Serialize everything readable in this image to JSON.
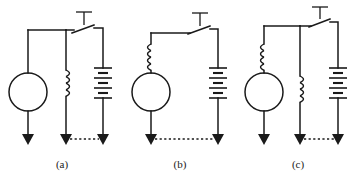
{
  "figure": {
    "background_color": "#ffffff",
    "line_color": "#1a1a1a",
    "width": 357,
    "height": 176
  },
  "circuits": [
    {
      "id": "a",
      "caption": "(a)",
      "caption_x": 62,
      "caption_y": 166,
      "branches": [
        "source",
        "inductor",
        "battery"
      ],
      "elements": {
        "source": {
          "name": "circle-source",
          "shape": "circle",
          "cx": 28,
          "cy": 92,
          "r": 19
        },
        "inductor": {
          "name": "inductor-coil",
          "turns": 4,
          "x": 65,
          "y_top": 70,
          "y_bottom": 96
        },
        "battery": {
          "name": "battery-cells",
          "cells": 3,
          "x": 103,
          "y_top": 68,
          "y_bottom": 100
        },
        "switch": {
          "name": "push-button-switch",
          "x_left": 66,
          "x_right": 103,
          "y": 30,
          "actuator": "T"
        }
      },
      "terminals": [
        {
          "name": "arrow-terminal-left",
          "x": 28,
          "y": 143
        },
        {
          "name": "arrow-terminal-middle",
          "x": 66,
          "y": 143
        },
        {
          "name": "arrow-terminal-right",
          "x": 103,
          "y": 143
        }
      ],
      "dashed_link": {
        "name": "dashed-connection",
        "x1": 68,
        "x2": 101,
        "y": 141
      }
    },
    {
      "id": "b",
      "caption": "(b)",
      "caption_x": 180,
      "caption_y": 166,
      "branches": [
        "source-with-inductor",
        "battery"
      ],
      "elements": {
        "source": {
          "name": "circle-source",
          "shape": "circle",
          "cx": 151,
          "cy": 92,
          "r": 19
        },
        "inductor": {
          "name": "inductor-coil",
          "turns": 4,
          "x": 151,
          "y_top": 44,
          "y_bottom": 70
        },
        "battery": {
          "name": "battery-cells",
          "cells": 3,
          "x": 218,
          "y_top": 68,
          "y_bottom": 100
        },
        "switch": {
          "name": "push-button-switch",
          "x_left": 182,
          "x_right": 218,
          "y": 30,
          "actuator": "T"
        }
      },
      "terminals": [
        {
          "name": "arrow-terminal-left",
          "x": 151,
          "y": 143
        },
        {
          "name": "arrow-terminal-right",
          "x": 218,
          "y": 143
        }
      ],
      "dashed_link": {
        "name": "dashed-connection",
        "x1": 153,
        "x2": 216,
        "y": 141
      }
    },
    {
      "id": "c",
      "caption": "(c)",
      "caption_x": 298,
      "caption_y": 166,
      "branches": [
        "source-with-inductor",
        "inductor",
        "battery"
      ],
      "elements": {
        "source": {
          "name": "circle-source",
          "shape": "circle",
          "cx": 264,
          "cy": 92,
          "r": 19
        },
        "inductor_left": {
          "name": "inductor-coil-left",
          "turns": 4,
          "x": 264,
          "y_top": 44,
          "y_bottom": 70
        },
        "inductor_middle": {
          "name": "inductor-coil-middle",
          "turns": 4,
          "x": 300,
          "y_top": 76,
          "y_bottom": 102
        },
        "battery": {
          "name": "battery-cells",
          "cells": 3,
          "x": 338,
          "y_top": 68,
          "y_bottom": 100
        },
        "switch": {
          "name": "push-button-switch",
          "x_left": 301,
          "x_right": 338,
          "y": 24,
          "actuator": "T"
        }
      },
      "terminals": [
        {
          "name": "arrow-terminal-left",
          "x": 264,
          "y": 143
        },
        {
          "name": "arrow-terminal-middle",
          "x": 300,
          "y": 143
        },
        {
          "name": "arrow-terminal-right",
          "x": 338,
          "y": 143
        }
      ],
      "dashed_link": {
        "name": "dashed-connection",
        "x1": 302,
        "x2": 336,
        "y": 141
      }
    }
  ],
  "captions": {
    "a": "(a)",
    "b": "(b)",
    "c": "(c)"
  }
}
